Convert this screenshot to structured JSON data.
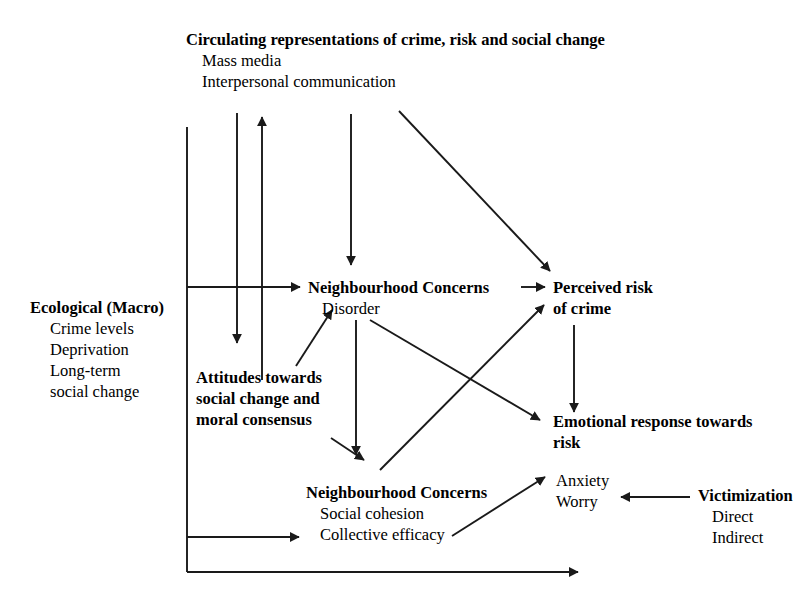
{
  "diagram": {
    "nodes": {
      "circulating": {
        "heading": "Circulating representations of crime, risk and social change",
        "items": [
          "Mass media",
          "Interpersonal communication"
        ]
      },
      "ecological": {
        "heading": "Ecological (Macro)",
        "items": [
          "Crime levels",
          "Deprivation",
          "Long-term",
          "social change"
        ]
      },
      "attitudes": {
        "line1": "Attitudes towards",
        "line2": "social change and",
        "line3": "moral consensus"
      },
      "concerns_disorder": {
        "heading": "Neighbourhood Concerns",
        "items": [
          "Disorder"
        ]
      },
      "concerns_cohesion": {
        "heading": "Neighbourhood Concerns",
        "items": [
          "Social cohesion",
          "Collective efficacy"
        ]
      },
      "perceived_risk": {
        "line1": "Perceived risk",
        "line2": "of crime"
      },
      "emotional_response": {
        "line1": "Emotional response towards",
        "line2": "risk",
        "items": [
          "Anxiety",
          "Worry"
        ]
      },
      "victimization": {
        "heading": "Victimization",
        "items": [
          "Direct",
          "Indirect"
        ]
      }
    },
    "colors": {
      "ink": "#1a1a1a",
      "background": "#ffffff"
    },
    "edges": [
      {
        "id": "spine-to-disorder",
        "from": "ecological",
        "to": "concerns_disorder"
      },
      {
        "id": "spine-to-collective-efficacy",
        "from": "ecological",
        "to": "concerns_cohesion"
      },
      {
        "id": "spine-bottom-outflow",
        "from": "ecological",
        "to": "time"
      },
      {
        "id": "attitudes-down",
        "from": "circulating",
        "to": "attitudes"
      },
      {
        "id": "attitudes-up",
        "from": "attitudes",
        "to": "circulating"
      },
      {
        "id": "media-to-disorder",
        "from": "circulating",
        "to": "concerns_disorder"
      },
      {
        "id": "media-to-perceived-risk",
        "from": "circulating",
        "to": "perceived_risk"
      },
      {
        "id": "disorder-to-perceived-risk",
        "from": "concerns_disorder",
        "to": "perceived_risk"
      },
      {
        "id": "disorder-to-cohesion",
        "from": "concerns_disorder",
        "to": "concerns_cohesion"
      },
      {
        "id": "disorder-to-emotional",
        "from": "concerns_disorder",
        "to": "emotional_response"
      },
      {
        "id": "attitudes-to-disorder",
        "from": "attitudes",
        "to": "concerns_disorder"
      },
      {
        "id": "attitudes-to-cohesion",
        "from": "attitudes",
        "to": "concerns_cohesion"
      },
      {
        "id": "cohesion-to-perceived-risk",
        "from": "concerns_cohesion",
        "to": "perceived_risk"
      },
      {
        "id": "collective-efficacy-to-anxiety",
        "from": "concerns_cohesion",
        "to": "emotional_response"
      },
      {
        "id": "perceived-risk-to-emotional",
        "from": "perceived_risk",
        "to": "emotional_response"
      },
      {
        "id": "victimization-to-worry",
        "from": "victimization",
        "to": "emotional_response"
      }
    ]
  }
}
